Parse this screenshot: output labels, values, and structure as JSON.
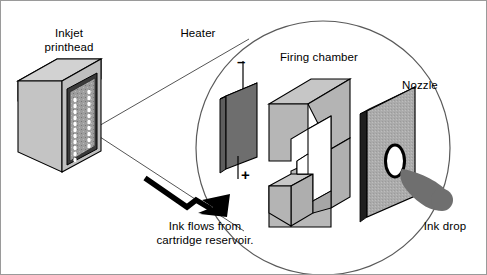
{
  "figure": {
    "background": "#ffffff",
    "border_color": "#9a9a9a",
    "width": 487,
    "height": 275
  },
  "colors": {
    "face_light": "#c9c9c9",
    "face_mid": "#b0b0b0",
    "face_dark": "#8f8f8f",
    "heater_dark": "#6e6e6e",
    "heater_edge": "#4a4a4a",
    "nozzle_plate": "#a8a8a8",
    "ink_drop": "#6f6f6f",
    "outline": "#000000",
    "leader_line": "#555555",
    "circle_stroke": "#5a5a5a"
  },
  "labels": {
    "printhead": {
      "line1": "Inkjet",
      "line2": "printhead"
    },
    "heater": "Heater",
    "firing_chamber": "Firing chamber",
    "nozzle": "Nozzle",
    "ink_drop": "Ink drop",
    "ink_flow": {
      "line1": "Ink flows from",
      "line2": "cartridge reservoir."
    }
  },
  "terminals": {
    "negative": "–",
    "positive": "+"
  },
  "printhead_nozzle_grid": {
    "columns": 2,
    "rows_per_column": 11,
    "dot_color": "#ffffff"
  },
  "icons": {
    "magnifier": "magnifier-circle-icon",
    "ink_flow_arrow": "ink-flow-arrow-icon",
    "ink_drop": "ink-drop-icon",
    "nozzle_hole": "nozzle-hole-icon"
  }
}
